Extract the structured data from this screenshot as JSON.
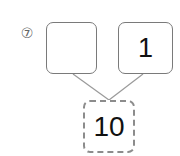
{
  "problem": {
    "number_label": "⑦",
    "left_box": {
      "value": ""
    },
    "right_box": {
      "value": "1"
    },
    "bottom_box": {
      "value": "10",
      "style": "dashed"
    }
  },
  "colors": {
    "box_border": "#7a7a7a",
    "dashed_border": "#8c8c8c",
    "connector_line": "#9a9a9a",
    "text": "#111111"
  }
}
